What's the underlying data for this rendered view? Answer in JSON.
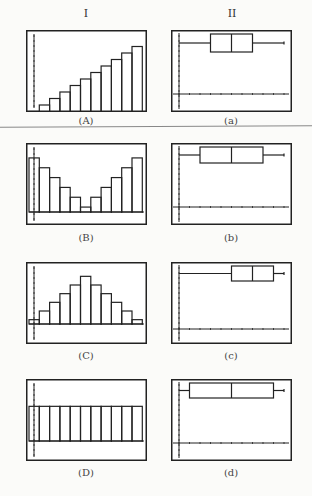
{
  "columns": {
    "left": "I",
    "right": "II"
  },
  "chart_data": [
    {
      "type": "bar",
      "id": "A",
      "caption": "(A)",
      "title": "Histogram A",
      "categories": [
        0,
        1,
        2,
        3,
        4,
        5,
        6,
        7,
        8,
        9,
        10
      ],
      "values": [
        1,
        2,
        3,
        4,
        5,
        6,
        7,
        8,
        9,
        10,
        11
      ],
      "ylim": [
        0,
        12
      ],
      "grid": false
    },
    {
      "type": "bar",
      "id": "B",
      "caption": "(B)",
      "title": "Histogram B",
      "categories": [
        0,
        1,
        2,
        3,
        4,
        5,
        6,
        7,
        8,
        9,
        10
      ],
      "values": [
        11,
        9,
        7,
        5,
        3,
        1,
        3,
        5,
        7,
        9,
        11
      ],
      "ylim": [
        0,
        12
      ],
      "grid": false
    },
    {
      "type": "bar",
      "id": "C",
      "caption": "(C)",
      "title": "Histogram C",
      "categories": [
        0,
        1,
        2,
        3,
        4,
        5,
        6,
        7,
        8,
        9,
        10
      ],
      "values": [
        1,
        3,
        5,
        7,
        9,
        11,
        9,
        7,
        5,
        3,
        1
      ],
      "ylim": [
        0,
        12
      ],
      "grid": false
    },
    {
      "type": "bar",
      "id": "D",
      "caption": "(D)",
      "title": "Histogram D",
      "categories": [
        0,
        1,
        2,
        3,
        4,
        5,
        6,
        7,
        8,
        9,
        10
      ],
      "values": [
        4,
        4,
        4,
        4,
        4,
        4,
        4,
        4,
        4,
        4,
        4
      ],
      "ylim": [
        0,
        6
      ],
      "grid": false
    },
    {
      "type": "box",
      "id": "a",
      "caption": "(a)",
      "title": "Box plot a",
      "min": 0,
      "q1": 3,
      "median": 5,
      "q3": 7,
      "max": 10,
      "xlim": [
        0,
        10
      ]
    },
    {
      "type": "box",
      "id": "b",
      "caption": "(b)",
      "title": "Box plot b",
      "min": 0,
      "q1": 2,
      "median": 5,
      "q3": 8,
      "max": 10,
      "xlim": [
        0,
        10
      ]
    },
    {
      "type": "box",
      "id": "c",
      "caption": "(c)",
      "title": "Box plot c",
      "min": 0,
      "q1": 5,
      "median": 7,
      "q3": 9,
      "max": 10,
      "xlim": [
        0,
        10
      ]
    },
    {
      "type": "box",
      "id": "d",
      "caption": "(d)",
      "title": "Box plot d",
      "min": 0,
      "q1": 1,
      "median": 5,
      "q3": 9,
      "max": 10,
      "xlim": [
        0,
        10
      ]
    }
  ],
  "layout": {
    "hist_frames": [
      {
        "x": 26,
        "y": 30,
        "axisY": 88
      },
      {
        "x": 26,
        "y": 143,
        "axisY": 69
      },
      {
        "x": 26,
        "y": 262,
        "axisY": 62
      },
      {
        "x": 26,
        "y": 379,
        "axisY": 62
      }
    ],
    "box_frames": [
      {
        "x": 171,
        "y": 30,
        "boxTop": 4,
        "boxBot": 22,
        "axisY": 64
      },
      {
        "x": 171,
        "y": 143,
        "boxTop": 4,
        "boxBot": 20,
        "axisY": 64
      },
      {
        "x": 171,
        "y": 262,
        "boxTop": 4,
        "boxBot": 19,
        "axisY": 67
      },
      {
        "x": 171,
        "y": 379,
        "boxTop": 4,
        "boxBot": 19,
        "axisY": 64
      }
    ],
    "caption_y": [
      115,
      232,
      350,
      467
    ]
  }
}
